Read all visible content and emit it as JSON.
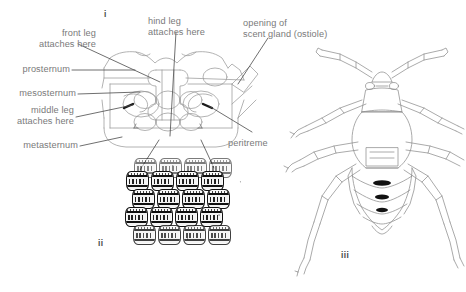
{
  "figure": {
    "background_color": "#ffffff",
    "ink_color": "#6b6b6b",
    "egg_ink_color": "#101010",
    "panels": [
      {
        "numeral": "i",
        "caption": "ventral view of thorax"
      },
      {
        "numeral": "ii",
        "caption": "egg batch"
      },
      {
        "numeral": "iii",
        "caption": "nymph, dorsal view"
      }
    ]
  },
  "panel_i": {
    "numeral": "i",
    "labels": {
      "front_leg": "front leg\nattaches here",
      "hind_leg": "hind leg\nattaches here",
      "scent_gland": "opening of\nscent gland (ostiole)",
      "prosternum": "prosternum",
      "mesosternum": "mesosternum",
      "middle_leg": "middle leg\nattaches here",
      "metasternum": "metasternum",
      "peritreme": "peritreme"
    }
  },
  "panel_ii": {
    "numeral": "ii",
    "egg_rows": [
      {
        "count": 4,
        "offset_x": 10,
        "offset_y": 0,
        "style": "partial"
      },
      {
        "count": 4,
        "offset_x": 2,
        "offset_y": 13,
        "style": "normal"
      },
      {
        "count": 4,
        "offset_x": 8,
        "offset_y": 31,
        "style": "normal"
      },
      {
        "count": 4,
        "offset_x": 1,
        "offset_y": 49,
        "style": "normal"
      },
      {
        "count": 4,
        "offset_x": 9,
        "offset_y": 67,
        "style": "faint"
      }
    ]
  },
  "panel_iii": {
    "numeral": "iii",
    "scent_gland_openings": 3
  }
}
